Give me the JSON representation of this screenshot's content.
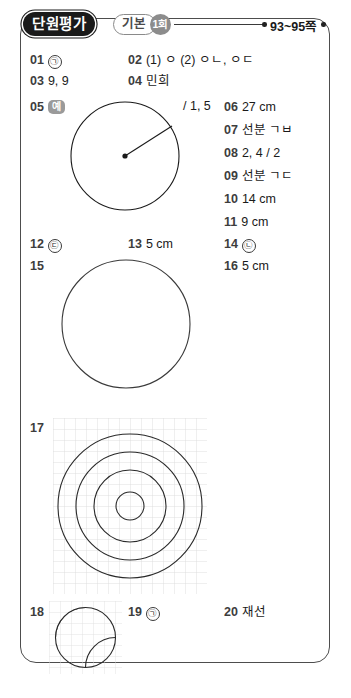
{
  "header": {
    "unit_label": "단원평가",
    "level_label": "기본",
    "round_label": "1회",
    "page_range": "93~95쪽"
  },
  "answers": [
    {
      "no": "01",
      "value": "㉠"
    },
    {
      "no": "02",
      "value": "(1) ㅇ  (2) ㅇㄴ, ㅇㄷ"
    },
    {
      "no": "03",
      "value": "9, 9"
    },
    {
      "no": "04",
      "value": "민희"
    },
    {
      "no": "05",
      "value": "예"
    },
    {
      "no": "06",
      "value": "27 cm"
    },
    {
      "no": "07",
      "value": "선분 ㄱㅂ"
    },
    {
      "no": "08",
      "value": "2, 4 / 2"
    },
    {
      "no": "09",
      "value": "선분 ㄱㄷ"
    },
    {
      "no": "10",
      "value": "14 cm"
    },
    {
      "no": "11",
      "value": "9 cm"
    },
    {
      "no": "12",
      "value": "㉢"
    },
    {
      "no": "13",
      "value": "5 cm"
    },
    {
      "no": "14",
      "value": "㉡"
    },
    {
      "no": "15",
      "value": ""
    },
    {
      "no": "16",
      "value": "5 cm"
    },
    {
      "no": "17",
      "value": ""
    },
    {
      "no": "18",
      "value": ""
    },
    {
      "no": "19",
      "value": "㉠"
    },
    {
      "no": "20",
      "value": "재선"
    }
  ],
  "fragment_05": "/ 1, 5",
  "figures": {
    "radius_circle_caption": "원과 반지름",
    "plain_circle_caption": "원",
    "concentric_caption": "동심원",
    "arcs_caption": "원 안의 두 곡선"
  }
}
